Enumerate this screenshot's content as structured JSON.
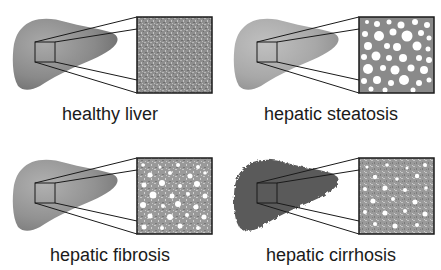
{
  "figure": {
    "panels": [
      {
        "id": "healthy",
        "label": "healthy liver",
        "liver_color": "#8a8a8a",
        "texture": "fine-granular",
        "col": 0,
        "row": 0
      },
      {
        "id": "steatosis",
        "label": "hepatic steatosis",
        "liver_color": "#a8a8a8",
        "texture": "large-white-vacuoles",
        "col": 1,
        "row": 0
      },
      {
        "id": "fibrosis",
        "label": "hepatic fibrosis",
        "liver_color": "#909090",
        "texture": "granular-with-white-spots",
        "col": 0,
        "row": 1
      },
      {
        "id": "cirrhosis",
        "label": "hepatic cirrhosis",
        "liver_color": "#555555",
        "texture": "granular-with-small-white-spots",
        "col": 1,
        "row": 1
      }
    ]
  }
}
